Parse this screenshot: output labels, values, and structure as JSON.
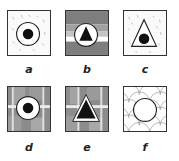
{
  "figure": {
    "panels": [
      {
        "id": "a",
        "label": "a",
        "background": "speckled-white",
        "outer_shape": "circle",
        "inner_shape": "filled-circle"
      },
      {
        "id": "b",
        "label": "b",
        "background": "horizontal-gray-bands",
        "outer_shape": "circle",
        "inner_shape": "filled-triangle"
      },
      {
        "id": "c",
        "label": "c",
        "background": "speckled-white",
        "outer_shape": "triangle",
        "inner_shape": "filled-circle"
      },
      {
        "id": "d",
        "label": "d",
        "background": "gray-grid-blocks",
        "outer_shape": "circle",
        "inner_shape": "filled-circle"
      },
      {
        "id": "e",
        "label": "e",
        "background": "gray-grid-blocks",
        "outer_shape": "triangle",
        "inner_shape": "filled-triangle"
      },
      {
        "id": "f",
        "label": "f",
        "background": "scallop-pattern",
        "outer_shape": "circle",
        "inner_shape": "none"
      }
    ],
    "colors": {
      "border": "#333333",
      "dark_gray": "#7a7a7a",
      "mid_gray": "#9a9a9a",
      "light_gray": "#c4c4c4",
      "fill": "#111111"
    }
  }
}
